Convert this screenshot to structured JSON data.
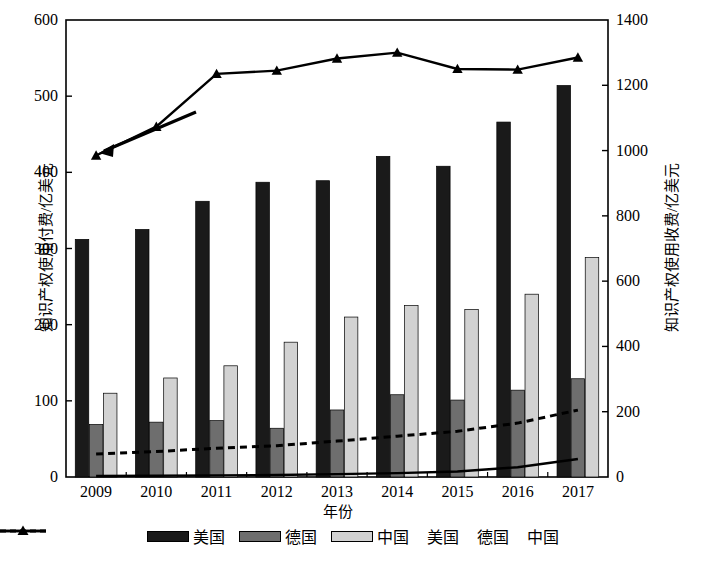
{
  "chart_data": {
    "type": "bar",
    "title": "",
    "xlabel": "年份",
    "ylabel": "知识产权使用付费/亿美元",
    "ylabel_right": "知识产权使用收费/亿美元",
    "categories": [
      "2009",
      "2010",
      "2011",
      "2012",
      "2013",
      "2014",
      "2015",
      "2016",
      "2017"
    ],
    "ylim": [
      0,
      600
    ],
    "ylim_right": [
      0,
      1400
    ],
    "yticks": [
      0,
      100,
      200,
      300,
      400,
      500,
      600
    ],
    "yticks_right": [
      0,
      200,
      400,
      600,
      800,
      1000,
      1200,
      1400
    ],
    "grid": false,
    "legend_position": "bottom",
    "series": [
      {
        "name": "美国",
        "type": "bar",
        "axis": "left",
        "color": "#1a1a1a",
        "values": [
          312,
          325,
          362,
          387,
          389,
          421,
          408,
          466,
          514
        ]
      },
      {
        "name": "德国",
        "type": "bar",
        "axis": "left",
        "color": "#6e6e6e",
        "values": [
          69,
          72,
          74,
          64,
          88,
          108,
          101,
          114,
          129
        ]
      },
      {
        "name": "中国",
        "type": "bar",
        "axis": "left",
        "color": "#d2d2d2",
        "values": [
          110,
          130,
          146,
          177,
          210,
          225,
          220,
          240,
          288
        ]
      },
      {
        "name": "美国",
        "type": "line",
        "axis": "right",
        "color": "#000000",
        "marker": "triangle",
        "values": [
          985,
          1073,
          1235,
          1245,
          1282,
          1300,
          1250,
          1248,
          1285
        ]
      },
      {
        "name": "德国",
        "type": "line",
        "axis": "right",
        "color": "#000000",
        "style": "dashed",
        "values": [
          70,
          78,
          88,
          96,
          110,
          125,
          140,
          165,
          205
        ]
      },
      {
        "name": "中国",
        "type": "line",
        "axis": "right",
        "color": "#000000",
        "style": "solid",
        "values": [
          3,
          4,
          5,
          6,
          9,
          12,
          17,
          30,
          55
        ]
      }
    ]
  },
  "axes": {
    "left_title": "知识产权使用付费/亿美元",
    "right_title": "知识产权使用收费/亿美元",
    "x_title": "年份",
    "left_ticks": [
      "0",
      "100",
      "200",
      "300",
      "400",
      "500",
      "600"
    ],
    "right_ticks": [
      "0",
      "200",
      "400",
      "600",
      "800",
      "1000",
      "1200",
      "1400"
    ],
    "x_ticks": [
      "2009",
      "2010",
      "2011",
      "2012",
      "2013",
      "2014",
      "2015",
      "2016",
      "2017"
    ]
  },
  "legend": {
    "items": [
      {
        "label": "美国",
        "kind": "bar",
        "color": "#1a1a1a"
      },
      {
        "label": "德国",
        "kind": "bar",
        "color": "#6e6e6e"
      },
      {
        "label": "中国",
        "kind": "bar",
        "color": "#d2d2d2"
      },
      {
        "label": "美国",
        "kind": "line-marker",
        "color": "#000000"
      },
      {
        "label": "德国",
        "kind": "line-dashed",
        "color": "#000000"
      },
      {
        "label": "中国",
        "kind": "line-solid",
        "color": "#000000"
      }
    ]
  },
  "annotation": {
    "arrow_left": true,
    "arrow_right": true
  }
}
